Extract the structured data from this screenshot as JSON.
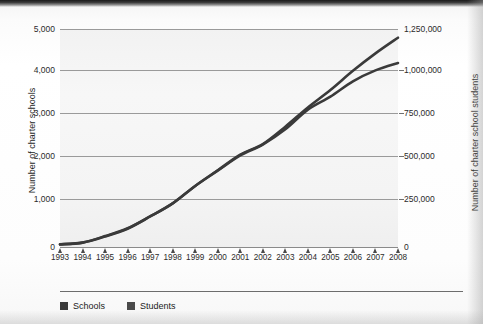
{
  "chart_data": {
    "type": "line",
    "title": "",
    "subtitle": "",
    "xlabel": "",
    "ylabel": "Number of charter schools",
    "y2label": "Number of charter school students",
    "grid": true,
    "legend_position": "bottom-left",
    "x": [
      1993,
      1994,
      1995,
      1996,
      1997,
      1998,
      1999,
      2000,
      2001,
      2002,
      2003,
      2004,
      2005,
      2006,
      2007,
      2008
    ],
    "categories": [
      "1993",
      "1994",
      "1995",
      "1996",
      "1997",
      "1998",
      "1999",
      "2000",
      "2001",
      "2002",
      "2003",
      "2004",
      "2005",
      "2006",
      "2007",
      "2008"
    ],
    "ylim": [
      0,
      5000
    ],
    "y2lim": [
      0,
      1250000
    ],
    "yticks": [
      0,
      1000,
      2000,
      3000,
      4000,
      5000
    ],
    "ytick_labels": [
      "0",
      "1,000",
      "2,000",
      "3,000",
      "4,000",
      "5,000"
    ],
    "y2ticks": [
      0,
      250000,
      500000,
      750000,
      1000000,
      1250000
    ],
    "y2tick_labels": [
      "0",
      "250,000",
      "500,000",
      "750,000",
      "1,000,000",
      "1,250,000"
    ],
    "series": [
      {
        "name": "Schools",
        "axis": "left",
        "color": "#3a3a3a",
        "values": [
          60,
          100,
          250,
          430,
          700,
          1000,
          1400,
          1750,
          2100,
          2350,
          2700,
          3150,
          3450,
          3800,
          4050,
          4220
        ]
      },
      {
        "name": "Students",
        "axis": "right",
        "color": "#3a3a3a",
        "values": [
          15000,
          25000,
          60000,
          105000,
          175000,
          250000,
          350000,
          440000,
          530000,
          590000,
          690000,
          800000,
          900000,
          1010000,
          1110000,
          1200000
        ]
      }
    ]
  },
  "axes": {
    "left": {
      "title": "Number of charter schools",
      "ticks": [
        "5,000",
        "4,000",
        "3,000",
        "2,000",
        "1,000",
        "0"
      ]
    },
    "right": {
      "title": "Number of charter school students",
      "ticks": [
        "1,250,000",
        "1,000,000",
        "750,000",
        "500,000",
        "250,000",
        "0"
      ]
    },
    "x": {
      "ticks": [
        "1993",
        "1994",
        "1995",
        "1996",
        "1997",
        "1998",
        "1999",
        "2000",
        "2001",
        "2002",
        "2003",
        "2004",
        "2005",
        "2006",
        "2007",
        "2008"
      ]
    }
  },
  "legend": {
    "items": [
      {
        "label": "Schools",
        "color": "#3a3a3a"
      },
      {
        "label": "Students",
        "color": "#4a4a4a"
      }
    ]
  },
  "colors": {
    "grid": "#9a9a9a",
    "plot_background": "#f4f4f4",
    "text": "#1f1f1f",
    "line_schools": "#3a3a3a",
    "line_students": "#4a4a4a"
  }
}
